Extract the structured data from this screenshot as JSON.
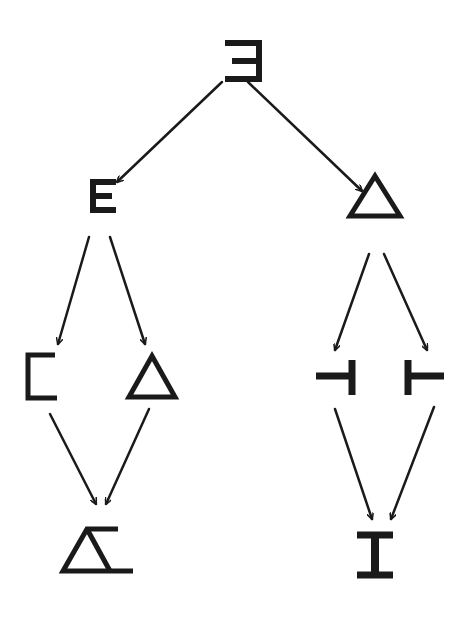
{
  "diagram": {
    "type": "tree",
    "ink_color": "#1a1a1a",
    "background": "#ffffff",
    "nodes": [
      {
        "id": "root",
        "label": "Ǝ",
        "shape": "reversed-E"
      },
      {
        "id": "left-1",
        "label": "E",
        "shape": "E"
      },
      {
        "id": "right-1",
        "label": "△",
        "shape": "triangle"
      },
      {
        "id": "left-2a",
        "label": "匚",
        "shape": "open-bracket"
      },
      {
        "id": "left-2b",
        "label": "△",
        "shape": "triangle"
      },
      {
        "id": "right-2a",
        "label": "⊣",
        "shape": "left-tack"
      },
      {
        "id": "right-2b",
        "label": "⊢",
        "shape": "right-tack"
      },
      {
        "id": "left-3",
        "label": "Δ̲",
        "shape": "triangle-with-lines"
      },
      {
        "id": "right-3",
        "label": "I",
        "shape": "I-beam"
      }
    ],
    "edges": [
      {
        "from": "root",
        "to": "left-1"
      },
      {
        "from": "root",
        "to": "right-1"
      },
      {
        "from": "left-1",
        "to": "left-2a"
      },
      {
        "from": "left-1",
        "to": "left-2b"
      },
      {
        "from": "right-1",
        "to": "right-2a"
      },
      {
        "from": "right-1",
        "to": "right-2b"
      },
      {
        "from": "left-2a",
        "to": "left-3"
      },
      {
        "from": "left-2b",
        "to": "left-3"
      },
      {
        "from": "right-2a",
        "to": "right-3"
      },
      {
        "from": "right-2b",
        "to": "right-3"
      }
    ]
  }
}
